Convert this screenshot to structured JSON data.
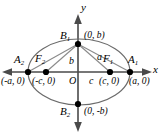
{
  "figure": {
    "type": "ellipse-diagram",
    "colors": {
      "ellipse_stroke": "#6b6b6b",
      "axis_stroke": "#4a4a4a",
      "radius_stroke": "#8a8a8a",
      "point_fill": "#000000",
      "label_color": "#000000",
      "background": "#ffffff"
    },
    "axes": {
      "x_label": "x",
      "y_label": "y",
      "origin_label": "O"
    },
    "points": [
      {
        "key": "B1",
        "name": "B",
        "sub": "1",
        "coord": "(0, b)",
        "x": 78,
        "y": 44
      },
      {
        "key": "A1",
        "name": "A",
        "sub": "1",
        "coord": "(a, 0)",
        "x": 130,
        "y": 72
      },
      {
        "key": "A2",
        "name": "A",
        "sub": "2",
        "coord": "(-a, 0)",
        "x": 28,
        "y": 72
      },
      {
        "key": "F1",
        "name": "F",
        "sub": "1",
        "coord": "(c, 0)",
        "x": 110,
        "y": 72
      },
      {
        "key": "F2",
        "name": "F",
        "sub": "2",
        "coord": "(-c, 0)",
        "x": 46,
        "y": 72
      },
      {
        "key": "B2",
        "name": "B",
        "sub": "2",
        "coord": "(0, -b)",
        "x": 78,
        "y": 104
      }
    ],
    "segments": [
      {
        "key": "a",
        "label": "a",
        "desc": "B1 to F1, semi-major length"
      },
      {
        "key": "b",
        "label": "b",
        "desc": "O to B1, semi-minor length"
      },
      {
        "key": "c",
        "label": "c",
        "desc": "O to F1, focal distance"
      }
    ],
    "labels": {
      "B1_name": "B",
      "B1_sub": "1",
      "B1_coord": "(0, b)",
      "B2_name": "B",
      "B2_sub": "2",
      "B2_coord": "(0, -b)",
      "A1_name": "A",
      "A1_sub": "1",
      "A1_coord": "(a, 0)",
      "A2_name": "A",
      "A2_sub": "2",
      "A2_coord": "(-a, 0)",
      "F1_name": "F",
      "F1_sub": "1",
      "F1_coord": "(c, 0)",
      "F2_name": "F",
      "F2_sub": "2",
      "F2_coord": "(-c, 0)",
      "seg_a": "a",
      "seg_b": "b",
      "seg_c": "c",
      "axis_x": "x",
      "axis_y": "y",
      "origin": "O"
    }
  }
}
